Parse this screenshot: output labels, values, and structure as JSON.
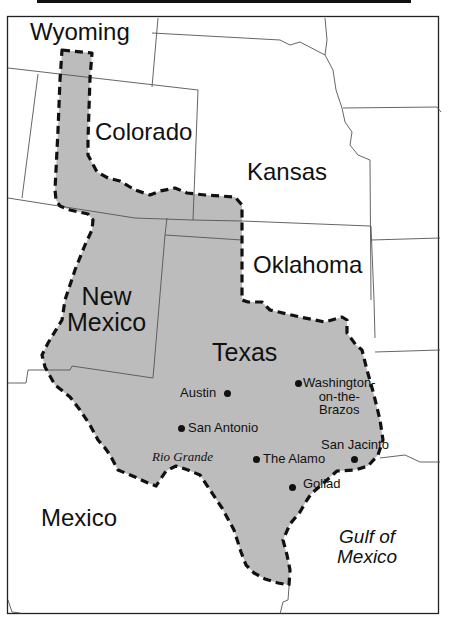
{
  "map": {
    "fill_color": "#bcbcbc",
    "border_color": "#111111",
    "state_line_color": "#555555",
    "territory_style": "dashed",
    "labels": {
      "wyoming": "Wyoming",
      "colorado": "Colorado",
      "kansas": "Kansas",
      "oklahoma": "Oklahoma",
      "new_mexico": "New\nMexico",
      "texas": "Texas",
      "mexico": "Mexico",
      "gulf": "Gulf of\nMexico",
      "rio_grande": "Rio Grande"
    },
    "cities": [
      {
        "name": "Austin",
        "x": 227,
        "y": 393
      },
      {
        "name": "Washington-\non-the-\nBrazos",
        "x": 298,
        "y": 383
      },
      {
        "name": "San Antonio",
        "x": 181,
        "y": 428
      },
      {
        "name": "San Jacinto",
        "x": 354,
        "y": 459
      },
      {
        "name": "The Alamo",
        "x": 256,
        "y": 459
      },
      {
        "name": "Goliad",
        "x": 292,
        "y": 487
      }
    ]
  }
}
